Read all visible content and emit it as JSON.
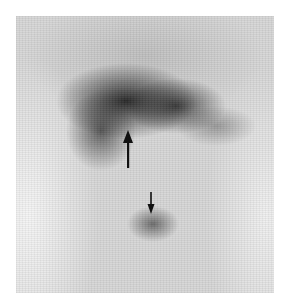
{
  "image": {
    "type": "planar scintigraphy",
    "background_color": "#ffffff",
    "frame": {
      "x": 16,
      "y": 16,
      "width": 258,
      "height": 277
    },
    "regions": [
      {
        "name": "upper-dark-uptake",
        "shape": "crescent",
        "tone": "#1e1e1e"
      },
      {
        "name": "lower-focal-uptake",
        "shape": "oval",
        "tone": "#505050"
      }
    ],
    "annotations": [
      {
        "name": "large-arrow",
        "direction": "up",
        "color": "#111111"
      },
      {
        "name": "small-arrow",
        "direction": "down",
        "color": "#111111"
      }
    ]
  }
}
